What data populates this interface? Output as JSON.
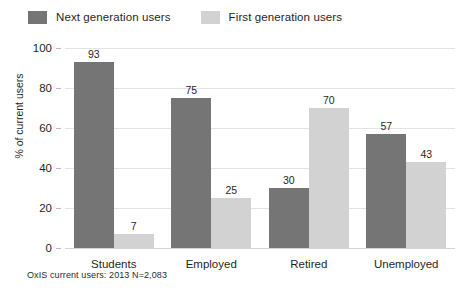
{
  "chart_data": {
    "type": "bar",
    "title": "",
    "subtitle": "",
    "xlabel": "",
    "ylabel": "% of current users",
    "ylim": [
      0,
      100
    ],
    "yticks": [
      0,
      20,
      40,
      60,
      80,
      100
    ],
    "ytick_labels": [
      "0",
      "20",
      "40",
      "60",
      "80",
      "100"
    ],
    "grid": true,
    "grid_axis": "y",
    "legend_position": "top-left",
    "categories": [
      "Students",
      "Employed",
      "Retired",
      "Unemployed"
    ],
    "series": [
      {
        "name": "Next generation users",
        "color": "#757575",
        "values": [
          93,
          75,
          30,
          57
        ],
        "value_labels": [
          "93",
          "75",
          "30",
          "57"
        ]
      },
      {
        "name": "First generation users",
        "color": "#d2d2d2",
        "values": [
          7,
          25,
          70,
          43
        ],
        "value_labels": [
          "7",
          "25",
          "70",
          "43"
        ]
      }
    ],
    "annotations": [
      "OxIS current users: 2013 N=2,083"
    ]
  },
  "legend": {
    "items": [
      {
        "label": "Next generation users",
        "color": "#757575"
      },
      {
        "label": "First generation users",
        "color": "#d2d2d2"
      }
    ]
  },
  "footnote": {
    "text": "OxIS current users: 2013 N=2,083"
  }
}
